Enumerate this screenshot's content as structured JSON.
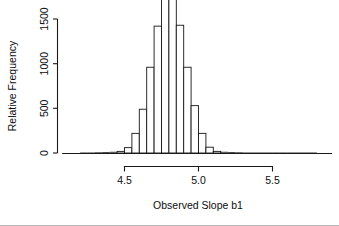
{
  "chart_data": {
    "type": "bar",
    "title": "",
    "subtitle": "",
    "xlabel": "Observed Slope b1",
    "ylabel": "Relative Frequency",
    "xlim": [
      4.17,
      5.83
    ],
    "ylim": [
      0,
      1850
    ],
    "xticks": [
      4.5,
      5.0,
      5.5
    ],
    "xticklabels": [
      "4.5",
      "5.0",
      "5.5"
    ],
    "yticks": [
      0,
      500,
      1000,
      1500
    ],
    "yticklabels": [
      "0",
      "500",
      "1000",
      "1500"
    ],
    "grid": false,
    "legend": false,
    "bin_width": 0.05,
    "bin_starts": [
      4.2,
      4.25,
      4.3,
      4.35,
      4.4,
      4.45,
      4.5,
      4.55,
      4.6,
      4.65,
      4.7,
      4.75,
      4.8,
      4.85,
      4.9,
      4.95,
      5.0,
      5.05,
      5.1,
      5.15,
      5.2,
      5.25,
      5.3,
      5.35,
      5.4,
      5.45,
      5.5,
      5.55,
      5.6,
      5.65,
      5.7,
      5.75
    ],
    "categories": [
      "4.20",
      "4.25",
      "4.30",
      "4.35",
      "4.40",
      "4.45",
      "4.50",
      "4.55",
      "4.60",
      "4.65",
      "4.70",
      "4.75",
      "4.80",
      "4.85",
      "4.90",
      "4.95",
      "5.00",
      "5.05",
      "5.10",
      "5.15",
      "5.20",
      "5.25",
      "5.30",
      "5.35",
      "5.40",
      "5.45",
      "5.50",
      "5.55",
      "5.60",
      "5.65",
      "5.70",
      "5.75"
    ],
    "values": [
      0,
      0,
      2,
      4,
      8,
      18,
      60,
      220,
      490,
      960,
      1420,
      1720,
      1790,
      1430,
      960,
      530,
      220,
      65,
      18,
      8,
      4,
      2,
      0,
      0,
      0,
      0,
      0,
      0,
      0,
      0,
      0,
      0
    ]
  },
  "axes": {
    "x_title": "Observed Slope b1",
    "y_title": "Relative Frequency",
    "x_tick_labels": [
      "4.5",
      "5.0",
      "5.5"
    ],
    "y_tick_labels": [
      "0",
      "500",
      "1000",
      "1500"
    ]
  },
  "style": {
    "line_color": "#1a1a1a",
    "bar_fill": "#ffffff",
    "bar_stroke": "#161616",
    "background": "#ffffff",
    "rule_color": "#b9b9b9"
  }
}
